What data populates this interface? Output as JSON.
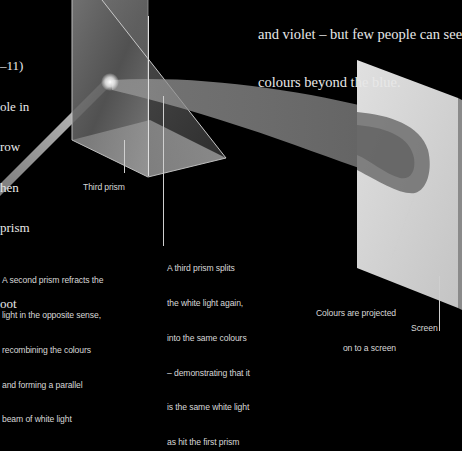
{
  "diagram": {
    "colors": {
      "background": "#000000",
      "text": "#e8e8e8",
      "caption": "#d8d8d8",
      "prism": "#9a9a9a",
      "screen": "#d4d4d4",
      "beam": "#bdbdbd"
    }
  },
  "top_right_text": {
    "lines": [
      "and violet – but few people can see",
      "colours beyond the blue."
    ]
  },
  "left_text_fragment": {
    "lines": [
      "–11)",
      "ole in",
      "row",
      "hen",
      "prism",
      "",
      "oot"
    ]
  },
  "labels": {
    "third_prism": "Third prism",
    "second_prism_caption": [
      "A second prism refracts the",
      "light in the opposite sense,",
      "recombining the colours",
      "and forming a parallel",
      "beam of white light"
    ],
    "third_prism_caption": [
      "A third prism splits",
      "the white light again,",
      "into the same colours",
      "– demonstrating that it",
      "is the same white light",
      "as hit the first prism"
    ],
    "projection_caption": [
      "Colours are projected",
      "on to a screen"
    ],
    "screen": "Screen"
  }
}
